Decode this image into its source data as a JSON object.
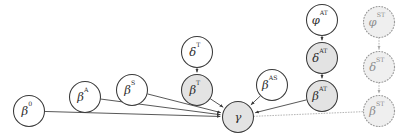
{
  "diagram": {
    "canvas": {
      "width": 407,
      "height": 140,
      "background": "#ffffff"
    },
    "styles": {
      "solid_stroke": "#3a3a3a",
      "dotted_stroke": "#9a9a9a",
      "shaded_fill": "#e3e3e3",
      "plain_fill": "#ffffff",
      "dotted_fill": "#efefef",
      "label_color": "#2e2e2e",
      "dotted_label_color": "#8e8e8e"
    },
    "nodes": [
      {
        "id": "beta0",
        "base": "β",
        "sup": "0",
        "label": "β⁰",
        "cx": 29,
        "cy": 111,
        "r": 15.5,
        "fill": "plain",
        "border": "solid"
      },
      {
        "id": "betaA",
        "base": "β",
        "sup": "A",
        "label": "β^A",
        "cx": 85,
        "cy": 97,
        "r": 15.5,
        "fill": "plain",
        "border": "solid"
      },
      {
        "id": "betaS",
        "base": "β",
        "sup": "S",
        "label": "β^S",
        "cx": 132,
        "cy": 90,
        "r": 15.5,
        "fill": "plain",
        "border": "solid"
      },
      {
        "id": "deltaT",
        "base": "δ",
        "sup": "T",
        "label": "δ^T",
        "cx": 197,
        "cy": 52,
        "r": 15.5,
        "fill": "plain",
        "border": "solid"
      },
      {
        "id": "betaT",
        "base": "β",
        "sup": "T",
        "label": "β^T",
        "cx": 197,
        "cy": 90,
        "r": 15.5,
        "fill": "shaded",
        "border": "solid"
      },
      {
        "id": "gamma",
        "base": "γ",
        "sup": "",
        "label": "γ",
        "cx": 238,
        "cy": 117,
        "r": 15.5,
        "fill": "shaded",
        "border": "solid"
      },
      {
        "id": "betaAS",
        "base": "β",
        "sup": "AS",
        "label": "β^AS",
        "cx": 272,
        "cy": 85,
        "r": 15.5,
        "fill": "plain",
        "border": "solid"
      },
      {
        "id": "phiAT",
        "base": "φ",
        "sup": "AT",
        "label": "φ^AT",
        "cx": 322,
        "cy": 20,
        "r": 15.5,
        "fill": "plain",
        "border": "solid"
      },
      {
        "id": "deltaAT",
        "base": "δ",
        "sup": "AT",
        "label": "δ^AT",
        "cx": 322,
        "cy": 58,
        "r": 15.5,
        "fill": "shaded",
        "border": "solid"
      },
      {
        "id": "betaAT",
        "base": "β",
        "sup": "AT",
        "label": "β^AT",
        "cx": 322,
        "cy": 96,
        "r": 15.5,
        "fill": "shaded",
        "border": "solid"
      },
      {
        "id": "phiST",
        "base": "φ",
        "sup": "ST",
        "label": "φ^ST",
        "cx": 379,
        "cy": 22,
        "r": 15.5,
        "fill": "dotted",
        "border": "dotted"
      },
      {
        "id": "deltaST",
        "base": "δ",
        "sup": "ST",
        "label": "δ^ST",
        "cx": 379,
        "cy": 67,
        "r": 15.5,
        "fill": "dotted",
        "border": "dotted"
      },
      {
        "id": "betaST",
        "base": "β",
        "sup": "ST",
        "label": "β^ST",
        "cx": 379,
        "cy": 111,
        "r": 15.5,
        "fill": "dotted",
        "border": "dotted"
      }
    ],
    "edges": [
      {
        "id": "e-beta0-gamma",
        "from": "beta0",
        "to": "gamma",
        "style": "solid",
        "arrow": true
      },
      {
        "id": "e-betaA-gamma",
        "from": "betaA",
        "to": "gamma",
        "style": "solid",
        "arrow": true
      },
      {
        "id": "e-betaS-gamma",
        "from": "betaS",
        "to": "gamma",
        "style": "solid",
        "arrow": true
      },
      {
        "id": "e-betaT-gamma",
        "from": "betaT",
        "to": "gamma",
        "style": "solid",
        "arrow": true
      },
      {
        "id": "e-betaAS-gamma",
        "from": "betaAS",
        "to": "gamma",
        "style": "solid",
        "arrow": true
      },
      {
        "id": "e-betaAT-gamma",
        "from": "betaAT",
        "to": "gamma",
        "style": "solid",
        "arrow": true
      },
      {
        "id": "e-deltaT-betaT",
        "from": "deltaT",
        "to": "betaT",
        "style": "solid",
        "arrow": true
      },
      {
        "id": "e-phiAT-deltaAT",
        "from": "phiAT",
        "to": "deltaAT",
        "style": "solid",
        "arrow": true
      },
      {
        "id": "e-deltaAT-betaAT",
        "from": "deltaAT",
        "to": "betaAT",
        "style": "solid",
        "arrow": true
      },
      {
        "id": "e-gamma-betaST",
        "from": "gamma",
        "to": "betaST",
        "style": "dotted",
        "arrow": false
      },
      {
        "id": "e-phiST-deltaST",
        "from": "phiST",
        "to": "deltaST",
        "style": "dotted",
        "arrow": true
      },
      {
        "id": "e-deltaST-betaST",
        "from": "deltaST",
        "to": "betaST",
        "style": "dotted",
        "arrow": true
      }
    ]
  }
}
